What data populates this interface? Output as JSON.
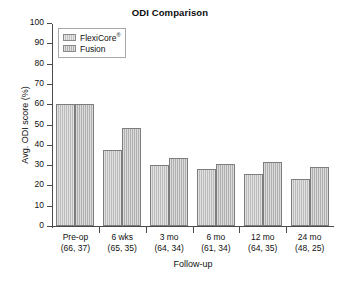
{
  "chart_data": {
    "type": "bar",
    "title": "ODI Comparison",
    "xlabel": "Follow-up",
    "ylabel": "Avg. ODI score (%)",
    "ylim": [
      0,
      100
    ],
    "ytick_step": 10,
    "yticks": [
      "100",
      "90",
      "80",
      "70",
      "60",
      "50",
      "40",
      "30",
      "20",
      "10",
      "0"
    ],
    "grid": false,
    "legend_position": "top-left inside plot",
    "categories": [
      "Pre-op",
      "6 wks",
      "3 mo",
      "6 mo",
      "12 mo",
      "24 mo"
    ],
    "category_sublabels": [
      "(66, 37)",
      "(65, 35)",
      "(64, 34)",
      "(61, 34)",
      "(64, 35)",
      "(48, 25)"
    ],
    "series": [
      {
        "name": "FlexiCore®",
        "name_base": "FlexiCore",
        "name_sup": "®",
        "color": "#bcbcbc",
        "values": [
          60,
          37.5,
          30,
          28,
          25.5,
          23
        ]
      },
      {
        "name": "Fusion",
        "name_base": "Fusion",
        "name_sup": "",
        "color": "#b0b0b0",
        "values": [
          60,
          48.5,
          33.5,
          30.5,
          31.5,
          29
        ]
      }
    ]
  },
  "colors": {
    "background": "#ffffff",
    "axis": "#4a4a4a",
    "bar_fill": "#bcbcbc",
    "bar_border": "#7d7d7d",
    "text": "#111111"
  }
}
